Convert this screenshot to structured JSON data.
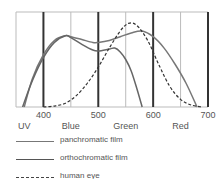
{
  "chart_data": {
    "type": "line",
    "title": "",
    "xlabel": "",
    "ylabel": "",
    "xlim": [
      350,
      700
    ],
    "ylim": [
      0,
      100
    ],
    "x_ticks": [
      400,
      500,
      600,
      700
    ],
    "band_labels": [
      {
        "label": "UV",
        "x": 365
      },
      {
        "label": "Blue",
        "x": 450
      },
      {
        "label": "Green",
        "x": 550
      },
      {
        "label": "Red",
        "x": 650
      }
    ],
    "grid": "vertical lines every 50 nm; thick at 400/500/600/700",
    "series": [
      {
        "name": "panchromatic film",
        "style": "solid",
        "color": "#777777",
        "x": [
          365,
          380,
          400,
          420,
          440,
          450,
          470,
          490,
          500,
          520,
          540,
          560,
          580,
          600,
          620,
          640,
          660,
          680
        ],
        "values": [
          0,
          30,
          55,
          70,
          75,
          74,
          71,
          68,
          68,
          70,
          74,
          78,
          80,
          74,
          62,
          45,
          25,
          0
        ]
      },
      {
        "name": "orthochromatic film",
        "style": "solid",
        "color": "#666666",
        "x": [
          362,
          380,
          400,
          420,
          440,
          450,
          470,
          490,
          500,
          520,
          530,
          540,
          550,
          560,
          570,
          580
        ],
        "values": [
          0,
          28,
          52,
          68,
          75,
          73,
          66,
          60,
          59,
          61,
          62,
          58,
          50,
          38,
          20,
          0
        ]
      },
      {
        "name": "human eye",
        "style": "dashed",
        "color": "#333333",
        "x": [
          400,
          420,
          440,
          460,
          480,
          500,
          520,
          540,
          555,
          570,
          590,
          610,
          630,
          650,
          670,
          690
        ],
        "values": [
          0,
          1,
          4,
          12,
          25,
          42,
          62,
          80,
          88,
          86,
          70,
          45,
          22,
          8,
          2,
          0
        ]
      }
    ]
  },
  "axis": {
    "ticks": [
      "400",
      "500",
      "600",
      "700"
    ],
    "bands": [
      "UV",
      "Blue",
      "Green",
      "Red"
    ]
  },
  "legend": [
    {
      "label": "panchromatic film",
      "style": "solid",
      "color": "#777777"
    },
    {
      "label": "orthochromatic film",
      "style": "solid",
      "color": "#555555"
    },
    {
      "label": "human eye",
      "style": "dashed",
      "color": "#444444"
    }
  ]
}
